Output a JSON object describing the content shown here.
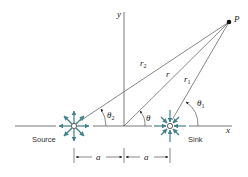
{
  "diagram": {
    "type": "source-sink pair geometry",
    "colors": {
      "line": "#555555",
      "arrow": "#3f7f86",
      "text": "#222222"
    },
    "labels": {
      "y_axis": "y",
      "x_axis": "x",
      "point": "P",
      "r2": "r",
      "r2_sub": "2",
      "r": "r",
      "r1": "r",
      "r1_sub": "1",
      "theta2": "θ",
      "theta2_sub": "2",
      "theta": "θ",
      "theta1": "θ",
      "theta1_sub": "1",
      "source": "Source",
      "sink": "Sink",
      "dim_left": "a",
      "dim_right": "a"
    }
  }
}
